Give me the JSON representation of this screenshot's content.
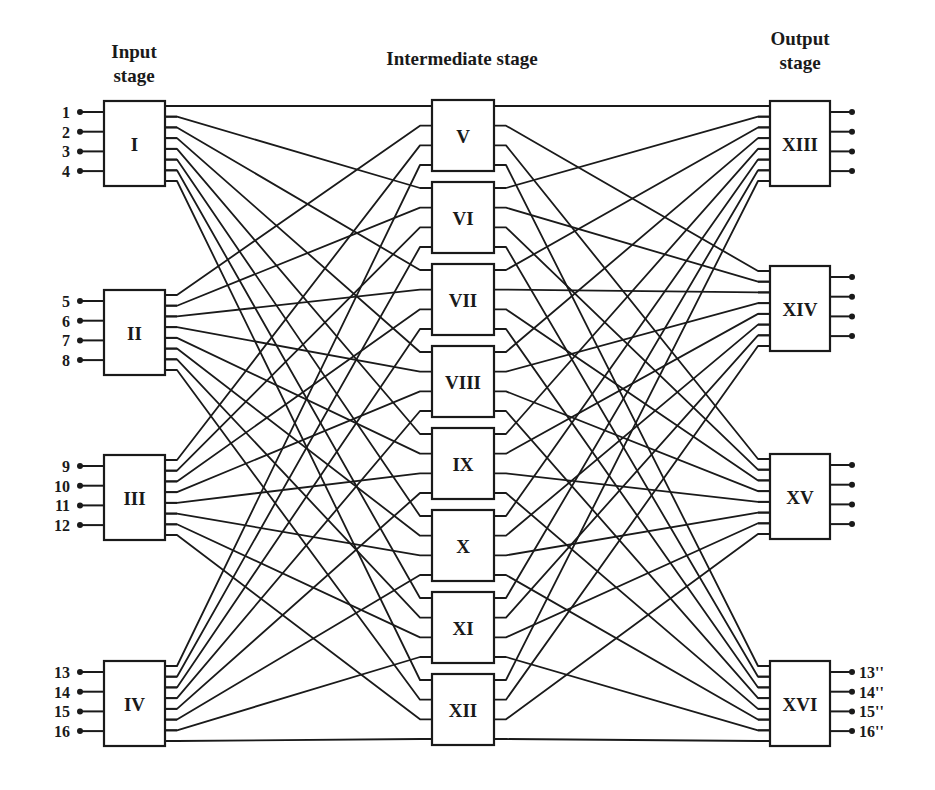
{
  "titles": {
    "input_stage_line1": "Input",
    "input_stage_line2": "stage",
    "intermediate_stage": "Intermediate stage",
    "output_stage_line1": "Output",
    "output_stage_line2": "stage"
  },
  "input_stage": {
    "blocks": [
      {
        "label": "I",
        "inputs": [
          "1",
          "2",
          "3",
          "4"
        ]
      },
      {
        "label": "II",
        "inputs": [
          "5",
          "6",
          "7",
          "8"
        ]
      },
      {
        "label": "III",
        "inputs": [
          "9",
          "10",
          "11",
          "12"
        ]
      },
      {
        "label": "IV",
        "inputs": [
          "13",
          "14",
          "15",
          "16"
        ]
      }
    ],
    "outputs_per_block": 8
  },
  "intermediate_stage": {
    "blocks": [
      {
        "label": "V"
      },
      {
        "label": "VI"
      },
      {
        "label": "VII"
      },
      {
        "label": "VIII"
      },
      {
        "label": "IX"
      },
      {
        "label": "X"
      },
      {
        "label": "XI"
      },
      {
        "label": "XII"
      }
    ],
    "inputs_per_block": 4,
    "outputs_per_block": 4
  },
  "output_stage": {
    "blocks": [
      {
        "label": "XIII",
        "outputs": [
          "",
          "",
          "",
          ""
        ]
      },
      {
        "label": "XIV",
        "outputs": [
          "",
          "",
          "",
          ""
        ]
      },
      {
        "label": "XV",
        "outputs": [
          "",
          "",
          "",
          ""
        ]
      },
      {
        "label": "XVI",
        "outputs": [
          "13''",
          "14''",
          "15''",
          "16''"
        ]
      }
    ],
    "inputs_per_block": 8
  },
  "connectivity": {
    "stage1_to_stage2": "input block i output k -> intermediate block k input i",
    "stage2_to_stage3": "intermediate block j output p -> output block p input j"
  }
}
